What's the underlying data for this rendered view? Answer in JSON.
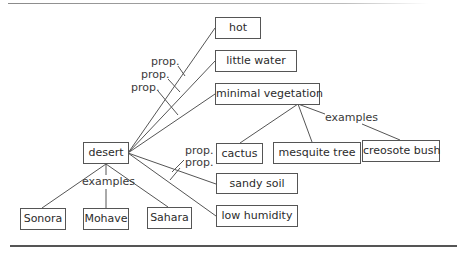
{
  "diagram": {
    "root": "desert",
    "properties": [
      "hot",
      "little water",
      "minimal vegetation",
      "sandy soil",
      "low humidity"
    ],
    "desert_examples": [
      "Sonora",
      "Mohave",
      "Sahara"
    ],
    "vegetation_examples": [
      "cactus",
      "mesquite tree",
      "creosote bush"
    ],
    "labels": {
      "prop1": "prop.",
      "prop2": "prop.",
      "prop3": "prop.",
      "prop4": "prop.",
      "prop5": "prop.",
      "examples_desert": "examples",
      "examples_vegetation": "examples"
    }
  }
}
